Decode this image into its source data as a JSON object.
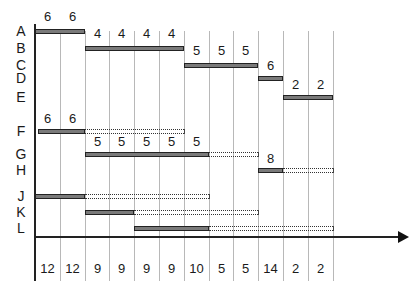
{
  "diagram": {
    "type": "resource-gantt",
    "grid": {
      "left": 35,
      "col_width": 24.8,
      "columns": 12
    },
    "rows": [
      {
        "label": "A",
        "y": 29,
        "bar": [
          0,
          2
        ],
        "slack_end": null,
        "values": [
          "6",
          "6"
        ],
        "values_y": 10
      },
      {
        "label": "B",
        "y": 46,
        "bar": [
          2,
          6
        ],
        "slack_end": null,
        "values": [
          "4",
          "4",
          "4",
          "4"
        ],
        "values_y": 27
      },
      {
        "label": "C",
        "y": 63,
        "bar": [
          6,
          9
        ],
        "slack_end": null,
        "values": [
          "5",
          "5",
          "5"
        ],
        "values_y": 44
      },
      {
        "label": "D",
        "y": 76,
        "bar": [
          9,
          10
        ],
        "slack_end": null,
        "values": [
          "6"
        ],
        "values_y": 59
      },
      {
        "label": "E",
        "y": 95,
        "bar": [
          10,
          12
        ],
        "slack_end": null,
        "values": [
          "2",
          "2"
        ],
        "values_y": 78
      },
      {
        "label": "F",
        "y": 129,
        "bar": [
          0,
          2
        ],
        "slack_end": 6,
        "values": [
          "6",
          "6"
        ],
        "values_y": 112
      },
      {
        "label": "G",
        "y": 152,
        "bar": [
          2,
          7
        ],
        "slack_end": 9,
        "values": [
          "5",
          "5",
          "5",
          "5",
          "5"
        ],
        "values_y": 135
      },
      {
        "label": "H",
        "y": 168,
        "bar": [
          9,
          10
        ],
        "slack_end": 12,
        "values": [
          "8"
        ],
        "values_y": 152
      },
      {
        "label": "J",
        "y": 194,
        "bar": [
          0,
          2
        ],
        "slack_end": 7,
        "values": [],
        "values_y": 0
      },
      {
        "label": "K",
        "y": 210,
        "bar": [
          2,
          4
        ],
        "slack_end": 9,
        "values": [],
        "values_y": 0
      },
      {
        "label": "L",
        "y": 226,
        "bar": [
          4,
          7
        ],
        "slack_end": 12,
        "values": [],
        "values_y": 0
      }
    ],
    "row_labels": [
      "A",
      "B",
      "C",
      "D",
      "E",
      "F",
      "G",
      "H",
      "J",
      "K",
      "L"
    ],
    "totals": [
      "12",
      "12",
      "9",
      "9",
      "9",
      "9",
      "10",
      "5",
      "5",
      "14",
      "2",
      "2"
    ],
    "colors": {
      "bar_fill": "#7a7a7a",
      "bar_border": "#222222",
      "grid": "#b8b8b8",
      "axis": "#222222"
    }
  }
}
